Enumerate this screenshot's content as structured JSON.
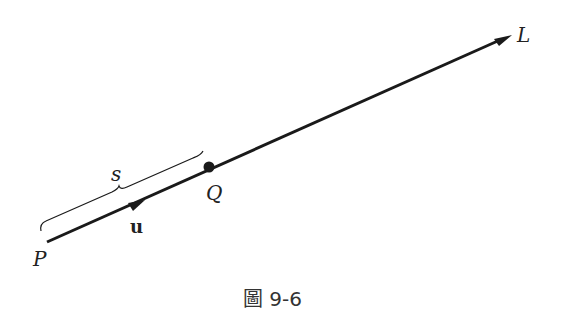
{
  "diagram": {
    "labels": {
      "line": "L",
      "start_point": "P",
      "point": "Q",
      "unit_vector": "u",
      "distance": "s"
    },
    "caption": "圖 9-6",
    "colors": {
      "stroke": "#1a1a1a",
      "background": "#ffffff"
    }
  }
}
